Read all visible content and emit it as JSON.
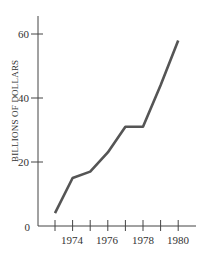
{
  "chart_data": {
    "type": "line",
    "title": "",
    "xlabel": "",
    "ylabel": "BILLIONS OF DOLLARS",
    "x": [
      1973,
      1974,
      1975,
      1976,
      1977,
      1978,
      1979,
      1980
    ],
    "series": [
      {
        "name": "",
        "values": [
          4,
          15,
          17,
          23,
          31,
          31,
          44,
          58
        ]
      }
    ],
    "x_tick_labels": [
      "1974",
      "1976",
      "1978",
      "1980"
    ],
    "y_tick_labels": [
      "0",
      "20",
      "40",
      "60"
    ],
    "ylim": [
      0,
      65
    ],
    "xlim": [
      1972,
      1981
    ],
    "grid": false,
    "legend": "none",
    "colors": {
      "line": "#555555",
      "axis": "#444444",
      "text": "#333333"
    }
  }
}
